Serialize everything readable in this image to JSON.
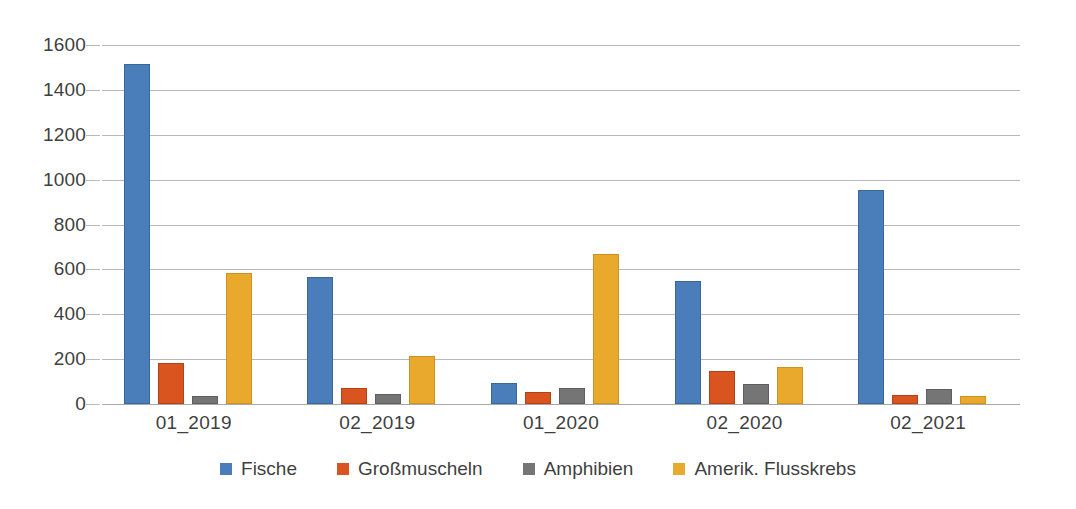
{
  "chart_data": {
    "type": "bar",
    "title": "",
    "subtitle": "",
    "xlabel": "",
    "ylabel": "",
    "ylim": [
      0,
      1600
    ],
    "ytick_step": 200,
    "yticks": [
      "0",
      "200",
      "400",
      "600",
      "800",
      "1000",
      "1200",
      "1400",
      "1600"
    ],
    "grid": true,
    "legend_position": "bottom",
    "orientation": "vertical",
    "grouping": "clustered",
    "categories": [
      "01_2019",
      "02_2019",
      "01_2020",
      "02_2020",
      "02_2021"
    ],
    "series": [
      {
        "name": "Fische",
        "color": "#4A7EBB",
        "values": [
          1515,
          566,
          95,
          550,
          953
        ]
      },
      {
        "name": "Großmuscheln",
        "color": "#D9541E",
        "values": [
          185,
          70,
          55,
          145,
          40
        ]
      },
      {
        "name": "Amphibien",
        "color": "#757575",
        "values": [
          35,
          45,
          70,
          90,
          68
        ]
      },
      {
        "name": "Amerik. Flusskrebs",
        "color": "#E9A92C",
        "values": [
          585,
          215,
          670,
          165,
          35
        ]
      }
    ]
  },
  "colors": {
    "fische": "#4A7EBB",
    "grossmuscheln": "#D9541E",
    "amphibien": "#757575",
    "flusskrebs": "#E9A92C",
    "gridline": "#b9b9b9",
    "axis_text": "#3f3f3f",
    "background": "#ffffff"
  }
}
